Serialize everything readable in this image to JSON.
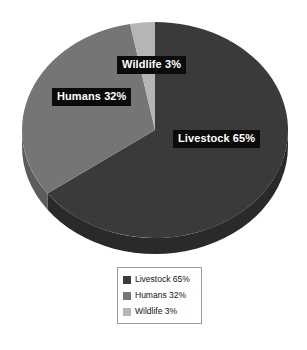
{
  "chart_data": {
    "type": "pie",
    "title": "",
    "subtitle": "",
    "xlabel": "",
    "ylabel": "",
    "categories": [
      "Livestock",
      "Humans",
      "Wildlife"
    ],
    "values": [
      65,
      32,
      3
    ],
    "unit": "%",
    "slices": [
      {
        "name": "Livestock",
        "value": 65,
        "label": "Livestock 65%",
        "color": "#3a3a3a",
        "side_color": "#2a2a2a"
      },
      {
        "name": "Humans",
        "value": 32,
        "label": "Humans 32%",
        "color": "#757575",
        "side_color": "#5c5c5c"
      },
      {
        "name": "Wildlife",
        "value": 3,
        "label": "Wildlife 3%",
        "color": "#b5b5b5",
        "side_color": "#8f8f8f"
      }
    ],
    "legend": {
      "position": "bottom-center",
      "border_color": "#9a9a9a",
      "background": "#ffffff",
      "entries": [
        {
          "label": "Livestock 65%",
          "color": "#3a3a3a"
        },
        {
          "label": "Humans 32%",
          "color": "#757575"
        },
        {
          "label": "Wildlife 3%",
          "color": "#b5b5b5"
        }
      ]
    },
    "grid": false,
    "style": {
      "three_d": true,
      "background": "#ffffff",
      "label_background": "#0b0b0b",
      "label_text_color": "#ffffff",
      "start_angle_deg": 0,
      "direction": "clockwise"
    },
    "annotations": [
      {
        "name": "wildlife-callout",
        "text": "Wildlife 3%"
      },
      {
        "name": "humans-callout",
        "text": "Humans 32%"
      },
      {
        "name": "livestock-callout",
        "text": "Livestock 65%"
      }
    ]
  }
}
